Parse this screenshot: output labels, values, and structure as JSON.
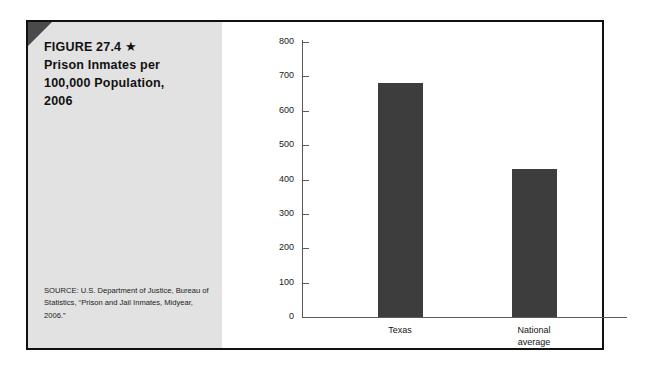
{
  "figure": {
    "label": "FIGURE 27.4",
    "star_icon": "★",
    "title_line_1": "Prison Inmates per",
    "title_line_2": "100,000 Population,",
    "title_line_3": "2006",
    "source": "SOURCE: U.S. Department of Justice, Bureau of Statistics, “Prison and Jail Inmates, Midyear, 2006.”",
    "bar_color": "#3d3d3d",
    "panel_color": "#e2e2e2",
    "frame_color": "#101010"
  },
  "chart_data": {
    "type": "bar",
    "title": "Prison Inmates per 100,000 Population, 2006",
    "categories": [
      "Texas",
      "National average"
    ],
    "category_lines": [
      [
        "Texas"
      ],
      [
        "National",
        "average"
      ]
    ],
    "values": [
      680,
      430
    ],
    "xlabel": "",
    "ylabel": "",
    "ylim": [
      0,
      800
    ],
    "ytick_step": 100,
    "yticks": [
      0,
      100,
      200,
      300,
      400,
      500,
      600,
      700,
      800
    ],
    "ytick_labels": [
      "0",
      "100",
      "200",
      "300",
      "400",
      "500",
      "600",
      "700",
      "800"
    ],
    "grid": false,
    "legend": null
  }
}
